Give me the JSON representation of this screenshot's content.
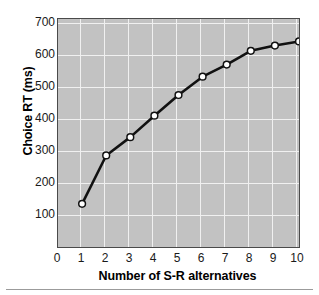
{
  "chart_data": {
    "type": "line",
    "title": "",
    "xlabel": "Number of S-R alternatives",
    "ylabel": "Choice RT (ms)",
    "x": [
      1,
      2,
      3,
      4,
      5,
      6,
      7,
      8,
      9,
      10
    ],
    "values": [
      175,
      315,
      368,
      430,
      490,
      543,
      578,
      618,
      633,
      645
    ],
    "series": [
      {
        "name": "Choice RT",
        "values": [
          175,
          315,
          368,
          430,
          490,
          543,
          578,
          618,
          633,
          645
        ]
      }
    ],
    "xlim": [
      0,
      10
    ],
    "ylim": [
      50,
      710
    ],
    "xticks": [
      "0",
      "1",
      "2",
      "3",
      "4",
      "5",
      "6",
      "7",
      "8",
      "9",
      "10"
    ],
    "yticks": [
      "100",
      "200",
      "300",
      "400",
      "500",
      "600",
      "700"
    ],
    "grid": true,
    "legend": null,
    "marker": "open-circle",
    "colors": {
      "plot_background": "#c2c2c2",
      "gridline": "#f0f0f0",
      "line": "#111111",
      "marker_fill": "#ffffff",
      "marker_edge": "#111111",
      "axis_text": "#1a1a1a",
      "frame": "#4a4a4a",
      "page_background": "#ffffff"
    }
  }
}
